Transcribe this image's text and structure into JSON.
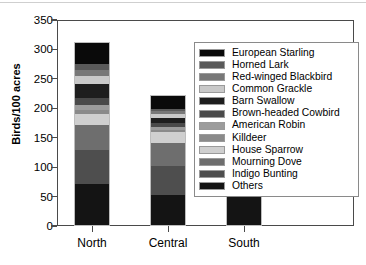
{
  "chart_data": {
    "type": "bar",
    "subtype": "stacked-bar",
    "title": "",
    "xlabel": "",
    "ylabel": "Birds/100 acres",
    "categories": [
      "North",
      "Central",
      "South"
    ],
    "ylim": [
      0,
      350
    ],
    "ytick_labels": [
      "0",
      "50",
      "100",
      "150",
      "200",
      "250",
      "300",
      "350"
    ],
    "ytick_values": [
      0,
      50,
      100,
      150,
      200,
      250,
      300,
      350
    ],
    "grid": false,
    "legend_position": "upper right",
    "totals": [
      309,
      219,
      250
    ],
    "series": [
      {
        "name": "European Starling",
        "color": "#0a0a0a",
        "values": [
          36,
          22,
          46
        ]
      },
      {
        "name": "Horned Lark",
        "color": "#5a5a5a",
        "values": [
          10,
          4,
          9
        ]
      },
      {
        "name": "Red-winged Blackbird",
        "color": "#787878",
        "values": [
          9,
          4,
          5
        ]
      },
      {
        "name": "Common Grackle",
        "color": "#c9c9c9",
        "values": [
          15,
          7,
          14
        ]
      },
      {
        "name": "Barn Swallow",
        "color": "#1e1e1e",
        "values": [
          23,
          9,
          12
        ]
      },
      {
        "name": "Brown-headed Cowbird",
        "color": "#4a4a4a",
        "values": [
          12,
          6,
          10
        ]
      },
      {
        "name": "American Robin",
        "color": "#9c9c9c",
        "values": [
          8,
          5,
          7
        ]
      },
      {
        "name": "Killdeer",
        "color": "#8a8a8a",
        "values": [
          7,
          4,
          6
        ]
      },
      {
        "name": "House Sparrow",
        "color": "#cfcfcf",
        "values": [
          19,
          18,
          24
        ]
      },
      {
        "name": "Mourning Dove",
        "color": "#6e6e6e",
        "values": [
          42,
          39,
          38
        ]
      },
      {
        "name": "Indigo Bunting",
        "color": "#4e4e4e",
        "values": [
          58,
          50,
          20
        ]
      },
      {
        "name": "Others",
        "color": "#141414",
        "values": [
          70,
          51,
          59
        ]
      }
    ]
  },
  "axis": {
    "y_title": "Birds/100 acres"
  },
  "legend": {
    "entries": [
      {
        "label": "European Starling"
      },
      {
        "label": "Horned Lark"
      },
      {
        "label": "Red-winged Blackbird"
      },
      {
        "label": "Common Grackle"
      },
      {
        "label": "Barn Swallow"
      },
      {
        "label": "Brown-headed Cowbird"
      },
      {
        "label": "American Robin"
      },
      {
        "label": "Killdeer"
      },
      {
        "label": "House Sparrow"
      },
      {
        "label": "Mourning Dove"
      },
      {
        "label": "Indigo Bunting"
      },
      {
        "label": "Others"
      }
    ]
  }
}
